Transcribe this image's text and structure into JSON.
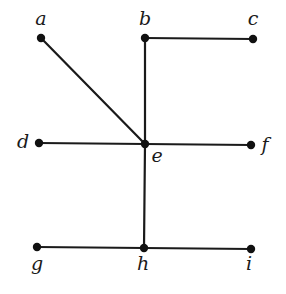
{
  "graph": {
    "nodes": [
      {
        "id": "a",
        "label": "a",
        "x": 41,
        "y": 38,
        "lx": 41,
        "ly": 25
      },
      {
        "id": "b",
        "label": "b",
        "x": 145,
        "y": 38,
        "lx": 145,
        "ly": 25
      },
      {
        "id": "c",
        "label": "c",
        "x": 253,
        "y": 39,
        "lx": 253,
        "ly": 25
      },
      {
        "id": "d",
        "label": "d",
        "x": 39,
        "y": 143,
        "lx": 23,
        "ly": 148
      },
      {
        "id": "e",
        "label": "e",
        "x": 145,
        "y": 144,
        "lx": 157,
        "ly": 162
      },
      {
        "id": "f",
        "label": "f",
        "x": 251,
        "y": 145,
        "lx": 265,
        "ly": 151
      },
      {
        "id": "g",
        "label": "g",
        "x": 37,
        "y": 247,
        "lx": 37,
        "ly": 270
      },
      {
        "id": "h",
        "label": "h",
        "x": 144,
        "y": 248,
        "lx": 143,
        "ly": 270
      },
      {
        "id": "i",
        "label": "i",
        "x": 251,
        "y": 249,
        "lx": 249,
        "ly": 270
      }
    ],
    "edges": [
      [
        "a",
        "e"
      ],
      [
        "b",
        "c"
      ],
      [
        "b",
        "e"
      ],
      [
        "d",
        "e"
      ],
      [
        "e",
        "f"
      ],
      [
        "e",
        "h"
      ],
      [
        "g",
        "h"
      ],
      [
        "h",
        "i"
      ]
    ],
    "colors": {
      "line": "#1a1a1a",
      "node": "#111111",
      "background": "#ffffff"
    }
  }
}
